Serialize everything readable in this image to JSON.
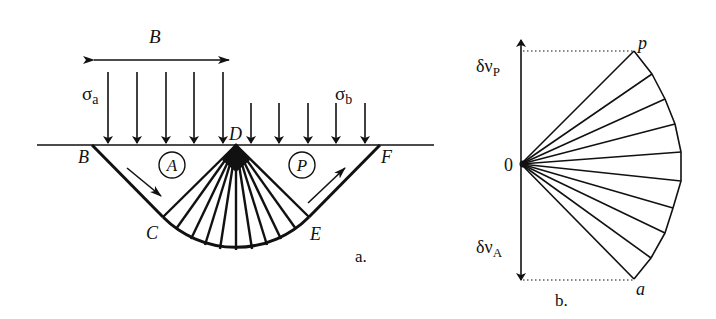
{
  "figure": {
    "panel_a": {
      "caption": "a.",
      "width_label": "B",
      "load_left_label": "σ",
      "load_left_sub": "a",
      "load_right_label": "σ",
      "load_right_sub": "b",
      "points": {
        "B": "B",
        "C": "C",
        "D": "D",
        "E": "E",
        "F": "F"
      },
      "zone_active": "A",
      "zone_passive": "P",
      "load_left_arrow_count": 5,
      "load_right_arrow_count": 5,
      "fan_line_count": 11
    },
    "panel_b": {
      "caption": "b.",
      "origin_label": "0",
      "velocity_top_label": "δν",
      "velocity_top_sub": "P",
      "velocity_bottom_label": "δν",
      "velocity_bottom_sub": "A",
      "point_top": "p",
      "point_bottom": "a",
      "fan_line_count": 10
    },
    "colors": {
      "ink": "#111111",
      "background": "#ffffff"
    }
  }
}
